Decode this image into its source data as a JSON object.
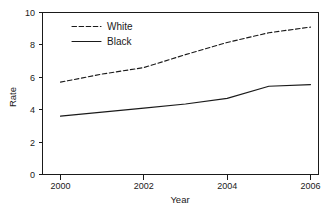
{
  "chart_data": {
    "type": "line",
    "title": "",
    "xlabel": "Year",
    "ylabel": "Rate",
    "x": [
      2000,
      2001,
      2002,
      2003,
      2004,
      2005,
      2006
    ],
    "xlim": [
      2000,
      2006
    ],
    "ylim": [
      0,
      10
    ],
    "xticks": [
      2000,
      2002,
      2004,
      2006
    ],
    "yticks": [
      0,
      2,
      4,
      6,
      8,
      10
    ],
    "xtick_labels": [
      "2000",
      "2002",
      "2004",
      "2006"
    ],
    "ytick_labels": [
      "0",
      "2",
      "4",
      "6",
      "8",
      "10"
    ],
    "grid": false,
    "legend_position": "upper-left-inside",
    "series": [
      {
        "name": "White",
        "style": "dashed",
        "color": "#1a1a1a",
        "values": [
          5.7,
          6.2,
          6.6,
          7.4,
          8.15,
          8.75,
          9.1
        ]
      },
      {
        "name": "Black",
        "style": "solid",
        "color": "#1a1a1a",
        "values": [
          3.6,
          3.85,
          4.1,
          4.35,
          4.7,
          5.45,
          5.55
        ]
      }
    ]
  },
  "legend": {
    "entries": [
      {
        "label": "White",
        "style": "dashed"
      },
      {
        "label": "Black",
        "style": "solid"
      }
    ]
  },
  "axes": {
    "x_title": "Year",
    "y_title": "Rate"
  }
}
